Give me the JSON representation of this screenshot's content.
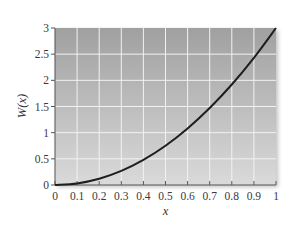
{
  "chart_data": {
    "type": "line",
    "title": "",
    "xlabel": "x",
    "ylabel": "W(x)",
    "xlim": [
      0,
      1
    ],
    "ylim": [
      0,
      3
    ],
    "grid": true,
    "legend": null,
    "x_ticks": [
      0,
      0.1,
      0.2,
      0.3,
      0.4,
      0.5,
      0.6,
      0.7,
      0.8,
      0.9,
      1
    ],
    "x_tick_labels": [
      "0",
      "0.1",
      "0.2",
      "0.3",
      "0.4",
      "0.5",
      "0.6",
      "0.7",
      "0.8",
      "0.9",
      "1"
    ],
    "y_ticks": [
      0,
      0.5,
      1,
      1.5,
      2,
      2.5,
      3
    ],
    "y_tick_labels": [
      "0",
      "0.5",
      "1",
      "1.5",
      "2",
      "2.5",
      "3"
    ],
    "series": [
      {
        "name": "W(x)",
        "x": [
          0,
          0.1,
          0.2,
          0.3,
          0.4,
          0.5,
          0.6,
          0.7,
          0.8,
          0.9,
          1.0
        ],
        "values": [
          0,
          0.03,
          0.12,
          0.27,
          0.48,
          0.75,
          1.08,
          1.47,
          1.92,
          2.43,
          3.0
        ]
      }
    ],
    "colors": {
      "curve": "#1e1e1e",
      "plot_bg_top": "#a0a0a0",
      "plot_bg_bottom": "#dadada",
      "grid": "#f2f2f2",
      "axis": "#555555"
    }
  }
}
